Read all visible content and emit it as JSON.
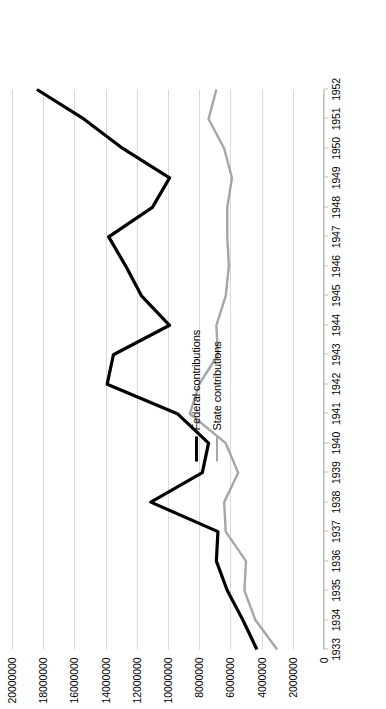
{
  "chart_data": {
    "type": "line",
    "title": "",
    "xlabel": "",
    "ylabel": "",
    "grid": true,
    "legend_position": "inside-left",
    "orientation": "rotated-90",
    "categories": [
      "1933",
      "1934",
      "1935",
      "1936",
      "1937",
      "1938",
      "1939",
      "1940",
      "1941",
      "1942",
      "1943",
      "1944",
      "1945",
      "1946",
      "1947",
      "1948",
      "1949",
      "1950",
      "1951",
      "1952"
    ],
    "ylim": [
      0,
      20000000
    ],
    "ytick_values": [
      20000000,
      18000000,
      16000000,
      14000000,
      12000000,
      10000000,
      8000000,
      6000000,
      4000000,
      2000000,
      0
    ],
    "ytick_labels": [
      "20000000",
      "18000000",
      "16000000",
      "14000000",
      "12000000",
      "10000000",
      "8000000",
      "6000000",
      "4000000",
      "2000000",
      "0"
    ],
    "series": [
      {
        "name": "Federal contributions",
        "color": "#000000",
        "width": 3.2,
        "values": [
          4300000,
          5200000,
          6200000,
          6900000,
          6800000,
          11100000,
          7800000,
          7400000,
          9400000,
          13900000,
          13500000,
          9900000,
          11700000,
          12700000,
          13800000,
          11000000,
          9900000,
          12900000,
          15400000,
          18400000
        ]
      },
      {
        "name": "State contributions",
        "color": "#a6a6a6",
        "width": 2.4,
        "values": [
          3000000,
          4400000,
          5100000,
          5000000,
          6300000,
          6400000,
          5500000,
          6300000,
          8600000,
          8000000,
          6800000,
          6900000,
          6300000,
          6100000,
          6200000,
          6200000,
          5900000,
          6400000,
          7400000,
          6900000
        ]
      }
    ]
  },
  "legend": {
    "entries": [
      {
        "label": "Federal contributions"
      },
      {
        "label": "State contributions"
      }
    ]
  },
  "colors": {
    "federal": "#000000",
    "state": "#a6a6a6",
    "gridline": "#d9d9d9",
    "axis": "#bfbfbf",
    "background": "#ffffff"
  }
}
